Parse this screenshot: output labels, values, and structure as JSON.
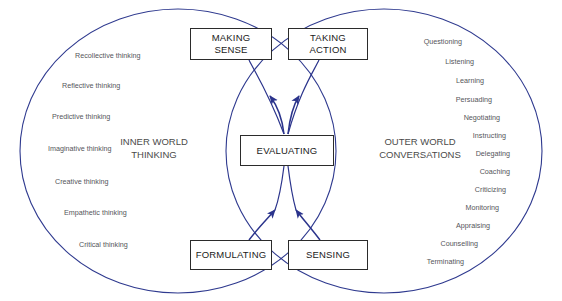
{
  "diagram": {
    "colors": {
      "ellipse_stroke": "#2f3a8f",
      "arrow_stroke": "#2b348c",
      "box_stroke": "#2b2b2b",
      "box_fill": "#ffffff",
      "node_text": "#1a1a1a",
      "region_text": "#4a4a4a",
      "item_text": "#55565a",
      "background": "#ffffff"
    },
    "regions": {
      "left": {
        "line1": "INNER WORLD",
        "line2": "THINKING"
      },
      "right": {
        "line1": "OUTER WORLD",
        "line2": "CONVERSATIONS"
      }
    },
    "nodes": {
      "making_sense": {
        "line1": "MAKING",
        "line2": "SENSE"
      },
      "taking_action": {
        "line1": "TAKING",
        "line2": "ACTION"
      },
      "evaluating": {
        "line1": "EVALUATING",
        "line2": ""
      },
      "formulating": {
        "line1": "FORMULATING",
        "line2": ""
      },
      "sensing": {
        "line1": "SENSING",
        "line2": ""
      }
    },
    "left_items": [
      "Recollective thinking",
      "Reflective thinking",
      "Predictive thinking",
      "Imaginative thinking",
      "Creative thinking",
      "Empathetic thinking",
      "Critical thinking"
    ],
    "right_items": [
      "Questioning",
      "Listening",
      "Learning",
      "Persuading",
      "Negotiating",
      "Instructing",
      "Delegating",
      "Coaching",
      "Criticizing",
      "Monitoring",
      "Appraising",
      "Counselling",
      "Terminating"
    ]
  }
}
